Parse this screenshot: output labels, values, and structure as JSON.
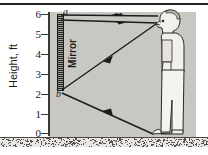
{
  "figure": {
    "panel_color": "#c9c7c2",
    "ink_color": "#23201e"
  },
  "axis": {
    "label": "Height, ft",
    "ticks": [
      "6",
      "5",
      "4",
      "3",
      "2",
      "1",
      "0"
    ],
    "min": 0,
    "max": 6,
    "unit": "ft"
  },
  "mirror": {
    "label": "Mirror",
    "top_point_label": "a",
    "bottom_point_label": "b",
    "top_height_ft": 6.0,
    "bottom_height_ft": 2.9
  },
  "person": {
    "name": "standing-man",
    "eye_height_ft": 5.6,
    "head_top_ft": 6.0,
    "foot_height_ft": 0.0
  },
  "rays": [
    {
      "name": "incident-ray-head-to-mirror-top",
      "from": "head",
      "to": "a"
    },
    {
      "name": "reflected-ray-mirror-top-to-eye",
      "from": "a",
      "to": "eye"
    },
    {
      "name": "incident-ray-foot-to-mirror-bottom",
      "from": "foot",
      "to": "b"
    },
    {
      "name": "reflected-ray-mirror-bottom-to-eye",
      "from": "b",
      "to": "eye"
    }
  ],
  "chart_data": {
    "type": "line",
    "xlabel": "",
    "ylabel": "Height, ft",
    "ylim": [
      0,
      6
    ],
    "yticks": [
      0,
      1,
      2,
      3,
      4,
      5,
      6
    ],
    "grid": false,
    "legend": "none",
    "annotations": [
      "a",
      "b",
      "Mirror",
      "Height, ft"
    ],
    "series": [
      {
        "name": "mirror-segment-ab",
        "x": [
          0.06,
          0.06
        ],
        "y": [
          6.0,
          2.9
        ]
      },
      {
        "name": "ray-head-to-a",
        "x": [
          0.95,
          0.06
        ],
        "y": [
          5.85,
          6.0
        ]
      },
      {
        "name": "ray-a-to-eye",
        "x": [
          0.06,
          0.95
        ],
        "y": [
          5.85,
          5.6
        ]
      },
      {
        "name": "ray-foot-to-b",
        "x": [
          0.93,
          0.06
        ],
        "y": [
          0.0,
          2.9
        ]
      },
      {
        "name": "ray-b-to-eye",
        "x": [
          0.06,
          0.95
        ],
        "y": [
          2.9,
          5.6
        ]
      }
    ]
  }
}
